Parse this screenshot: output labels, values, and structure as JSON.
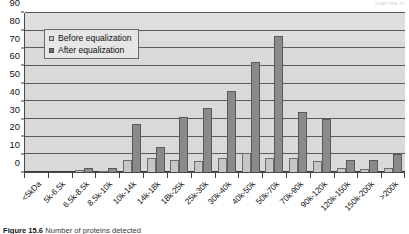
{
  "runhead": "CHAPTER 15",
  "legend": {
    "position": "top-left-inside",
    "items": [
      {
        "label": "Before equalization",
        "swatch": "before",
        "color": "#c6c6c6"
      },
      {
        "label": "After equalization",
        "swatch": "after",
        "color": "#6f6f6f"
      }
    ]
  },
  "caption": {
    "figure_number": "Figure 15.6",
    "text": "Number of proteins detected"
  },
  "chart_data": {
    "type": "bar",
    "title": "",
    "subtitle": "",
    "xlabel": "",
    "ylabel": "",
    "ylim": [
      0,
      90
    ],
    "ytick_step": 10,
    "yticks": [
      0,
      10,
      20,
      30,
      40,
      50,
      60,
      70,
      80,
      90
    ],
    "grid": true,
    "legend_position": "inside-top-left",
    "categories": [
      "<5kDa",
      "5k-6.5k",
      "6.5k-8.5k",
      "8.5k-10k",
      "10k-14k",
      "14k-18k",
      "18k-25k",
      "25k-30k",
      "30k-40k",
      "40k-50k",
      "50k-70k",
      "70k-90k",
      "90k-120k",
      "120k-150k",
      "150k-200k",
      ">200k"
    ],
    "series": [
      {
        "name": "Before equalization",
        "color": "#c6c6c6",
        "values": [
          0,
          0,
          1,
          0.5,
          7,
          8,
          7,
          6.5,
          8,
          11,
          8,
          8,
          6,
          2,
          1.5,
          2
        ]
      },
      {
        "name": "After equalization",
        "color": "#8a8a8a",
        "values": [
          0,
          0,
          2,
          2,
          27,
          14,
          31,
          36,
          46,
          62,
          77,
          34,
          30,
          7,
          7,
          10
        ]
      }
    ]
  }
}
